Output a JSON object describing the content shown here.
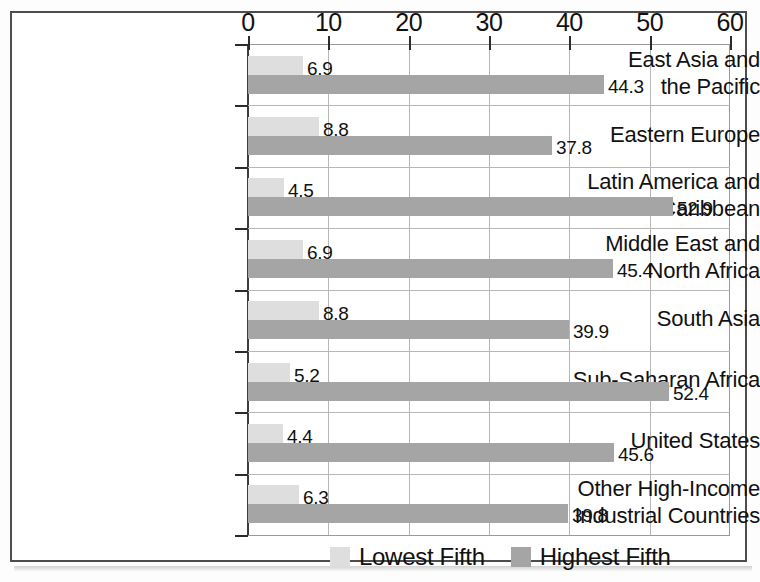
{
  "chart_data": {
    "type": "bar",
    "orientation": "horizontal",
    "title": "",
    "subtitle": "",
    "xlabel": "",
    "ylabel": "",
    "xlim": [
      0,
      60
    ],
    "xticks": [
      0,
      10,
      20,
      30,
      40,
      50,
      60
    ],
    "xtick_labels": [
      "0",
      "10",
      "20",
      "30",
      "40",
      "50",
      "60"
    ],
    "grid": true,
    "legend_position": "bottom",
    "categories": [
      "East Asia and\nthe Pacific",
      "Eastern Europe",
      "Latin America and\nthe Caribbean",
      "Middle East and\nNorth Africa",
      "South Asia",
      "Sub-Saharan Africa",
      "United States",
      "Other High-Income\nIndustrial Countries"
    ],
    "series": [
      {
        "name": "Lowest Fifth",
        "color": "#dedede",
        "values": [
          6.9,
          8.8,
          4.5,
          6.9,
          8.8,
          5.2,
          4.4,
          6.3
        ],
        "value_labels": [
          "6.9",
          "8.8",
          "4.5",
          "6.9",
          "8.8",
          "5.2",
          "4.4",
          "6.3"
        ]
      },
      {
        "name": "Highest Fifth",
        "color": "#a5a5a5",
        "values": [
          44.3,
          37.8,
          52.9,
          45.4,
          39.9,
          52.4,
          45.6,
          39.8
        ],
        "value_labels": [
          "44.3",
          "37.8",
          "52.9",
          "45.4",
          "39.9",
          "52.4",
          "45.6",
          "39.8"
        ]
      }
    ]
  },
  "legend": {
    "items": [
      {
        "label": "Lowest Fifth",
        "color": "#dedede"
      },
      {
        "label": "Highest Fifth",
        "color": "#a5a5a5"
      }
    ]
  },
  "colors": {
    "lowest_fifth": "#dedede",
    "highest_fifth": "#a5a5a5",
    "axis": "#2b2b2b",
    "grid": "#b7b7b7",
    "frame": "#4d4d4d"
  }
}
